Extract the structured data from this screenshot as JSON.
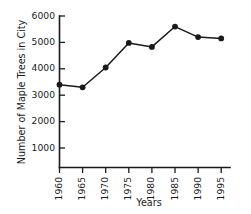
{
  "chart_data": {
    "type": "line",
    "title": "",
    "subtitle": "",
    "xlabel": "Years",
    "ylabel": "Number of Maple Trees in City",
    "x": [
      1960,
      1965,
      1970,
      1975,
      1980,
      1985,
      1990,
      1995
    ],
    "categories": [
      "1960",
      "1965",
      "1970",
      "1975",
      "1980",
      "1985",
      "1990",
      "1995"
    ],
    "values": [
      3400,
      3300,
      4050,
      4980,
      4830,
      5600,
      5200,
      5150
    ],
    "series": [
      {
        "name": "Maple Trees",
        "values": [
          3400,
          3300,
          4050,
          4980,
          4830,
          5600,
          5200,
          5150
        ]
      }
    ],
    "xlim": [
      1960,
      1995
    ],
    "ylim": [
      0,
      6000
    ],
    "ytick_labels": [
      "1000",
      "2000",
      "3000",
      "4000",
      "5000",
      "6000"
    ],
    "ytick_values": [
      1000,
      2000,
      3000,
      4000,
      5000,
      6000
    ],
    "xtick_labels": [
      "1960",
      "1965",
      "1970",
      "1975",
      "1980",
      "1985",
      "1990",
      "1995"
    ],
    "xtick_rotation": 90,
    "grid": false,
    "legend": false,
    "legend_position": "none",
    "marker": "circle",
    "line_color": "#1a1a1a",
    "marker_color": "#1a1a1a",
    "background_color": "#ffffff"
  },
  "axes": {
    "y_title": "Number of Maple Trees in City",
    "x_title": "Years"
  }
}
